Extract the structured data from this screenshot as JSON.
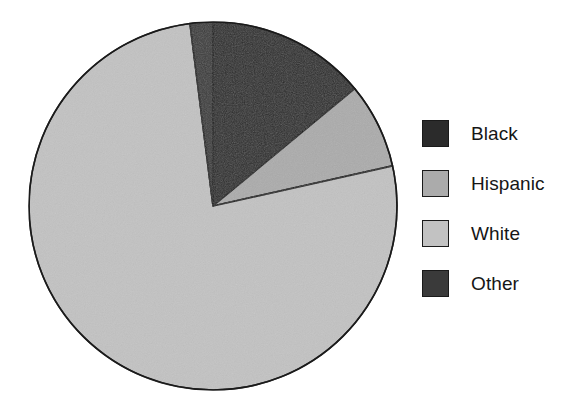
{
  "figure": {
    "type": "pie-chart-figure",
    "background": "#ffffff"
  },
  "legend": {
    "position": "right",
    "items": [
      {
        "label": "Black",
        "color": "#2b2b2b",
        "swatch_name": "legend-swatch-black"
      },
      {
        "label": "Hispanic",
        "color": "#ababab",
        "swatch_name": "legend-swatch-hispanic"
      },
      {
        "label": "White",
        "color": "#c2c2c2",
        "swatch_name": "legend-swatch-white"
      },
      {
        "label": "Other",
        "color": "#3a3a3a",
        "swatch_name": "legend-swatch-other"
      }
    ]
  },
  "pie": {
    "center_x": 213,
    "center_y": 206,
    "radius": 184,
    "stroke": "#1a1a1a",
    "stroke_width": 1.6,
    "start_angle_deg": 0,
    "slices": [
      {
        "label": "Black",
        "percent": 14.0,
        "start_deg": 0.0,
        "end_deg": 50.4,
        "color": "#2b2b2b"
      },
      {
        "label": "Hispanic",
        "percent": 7.5,
        "start_deg": 50.4,
        "end_deg": 77.4,
        "color": "#ababab"
      },
      {
        "label": "White",
        "percent": 76.5,
        "start_deg": 77.4,
        "end_deg": 352.8,
        "color": "#c2c2c2"
      },
      {
        "label": "Other",
        "percent": 2.0,
        "start_deg": 352.8,
        "end_deg": 360.0,
        "color": "#3a3a3a"
      }
    ]
  },
  "chart_data": {
    "type": "pie",
    "title": "",
    "subtitle": "",
    "xlabel": "",
    "ylabel": "",
    "grid": false,
    "legend_position": "right",
    "units": "percent",
    "start_angle_deg": 0,
    "direction": "clockwise",
    "categories": [
      "Black",
      "Hispanic",
      "White",
      "Other"
    ],
    "values": [
      14.0,
      7.5,
      76.5,
      2.0
    ],
    "colors": [
      "#2b2b2b",
      "#ababab",
      "#c2c2c2",
      "#3a3a3a"
    ],
    "slices": [
      {
        "name": "Black",
        "value": 14.0,
        "color": "#2b2b2b"
      },
      {
        "name": "Hispanic",
        "value": 7.5,
        "color": "#ababab"
      },
      {
        "name": "White",
        "value": 76.5,
        "color": "#c2c2c2"
      },
      {
        "name": "Other",
        "value": 2.0,
        "color": "#3a3a3a"
      }
    ],
    "annotations": []
  }
}
